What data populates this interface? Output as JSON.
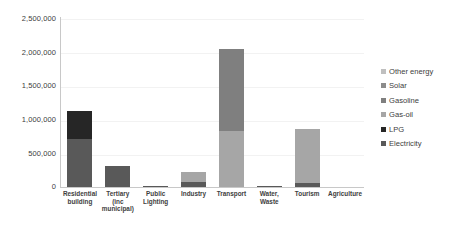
{
  "chart_data": {
    "type": "bar",
    "subtype": "stacked-bar",
    "title": "",
    "xlabel": "",
    "ylabel": "",
    "ylim": [
      0,
      2500000
    ],
    "ytick_labels": [
      "2,500,000",
      "2,000,000",
      "1,500,000",
      "1,000,000",
      "500,000",
      "0"
    ],
    "ytick_values": [
      2500000,
      2000000,
      1500000,
      1000000,
      500000,
      0
    ],
    "grid": true,
    "legend_position": "right",
    "categories": [
      "Residential building",
      "Tertiary (inc municipal)",
      "Public Lighting",
      "Industry",
      "Transport",
      "Water, Waste",
      "Tourism",
      "Agriculture"
    ],
    "series": [
      {
        "name": "Electricity",
        "color": "#595959",
        "values": [
          700000,
          305000,
          8000,
          80000,
          0,
          20000,
          55000,
          0
        ]
      },
      {
        "name": "LPG",
        "color": "#262626",
        "values": [
          420000,
          0,
          0,
          0,
          0,
          0,
          0,
          0
        ]
      },
      {
        "name": "Gas-oil",
        "color": "#a6a6a6",
        "values": [
          0,
          0,
          0,
          145000,
          830000,
          0,
          805000,
          0
        ]
      },
      {
        "name": "Gasoline",
        "color": "#7f7f7f",
        "values": [
          0,
          0,
          0,
          0,
          1200000,
          0,
          0,
          0
        ]
      },
      {
        "name": "Solar",
        "color": "#8c8c8c",
        "values": [
          0,
          0,
          0,
          0,
          0,
          0,
          0,
          0
        ]
      },
      {
        "name": "Other energy",
        "color": "#bfbfbf",
        "values": [
          0,
          0,
          0,
          0,
          0,
          0,
          0,
          0
        ]
      }
    ],
    "totals": [
      1120000,
      305000,
      8000,
      225000,
      2030000,
      20000,
      860000,
      0
    ],
    "legend_entries": [
      {
        "label": "Other energy",
        "color": "#bfbfbf"
      },
      {
        "label": "Solar",
        "color": "#8c8c8c"
      },
      {
        "label": "Gasoline",
        "color": "#7f7f7f"
      },
      {
        "label": "Gas-oil",
        "color": "#a6a6a6"
      },
      {
        "label": "LPG",
        "color": "#262626"
      },
      {
        "label": "Electricity",
        "color": "#595959"
      }
    ]
  }
}
